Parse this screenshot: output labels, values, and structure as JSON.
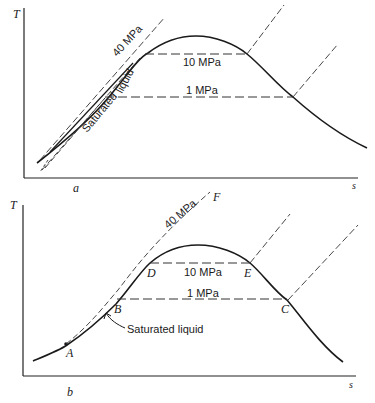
{
  "figure": {
    "panels": [
      {
        "id": "a",
        "panel_label": "a",
        "y_axis_label": "T",
        "x_axis_label": "s",
        "isobars": {
          "high": "40 MPa",
          "mid": "10 MPa",
          "low": "1 MPa"
        },
        "curve_label_part1": "Saturated",
        "curve_label_part2": "liquid"
      },
      {
        "id": "b",
        "panel_label": "b",
        "y_axis_label": "T",
        "x_axis_label": "s",
        "isobars": {
          "high": "40 MPa",
          "mid": "10 MPa",
          "low": "1 MPa"
        },
        "curve_label": "Saturated liquid",
        "points": {
          "A": "A",
          "B": "B",
          "C": "C",
          "D": "D",
          "E": "E",
          "F": "F"
        }
      }
    ]
  }
}
